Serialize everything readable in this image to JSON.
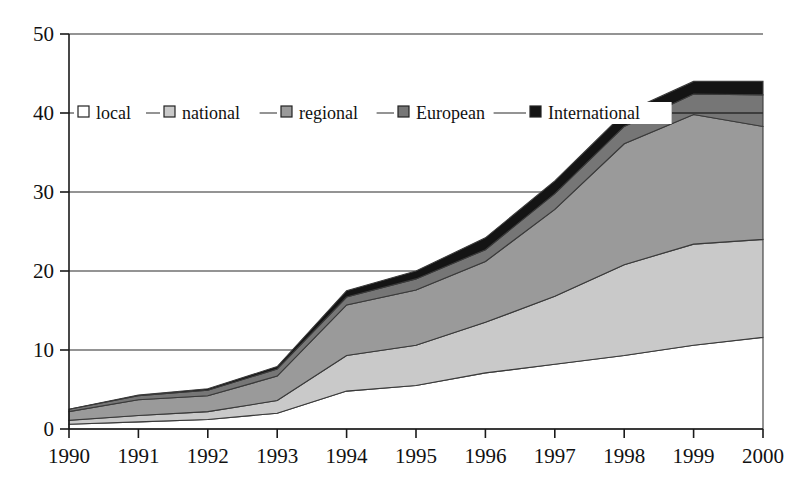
{
  "chart_data": {
    "type": "area",
    "stacked": true,
    "title": "",
    "xlabel": "",
    "ylabel": "",
    "x": [
      1990,
      1991,
      1992,
      1993,
      1994,
      1995,
      1996,
      1997,
      1998,
      1999,
      2000
    ],
    "categories": [
      "1990",
      "1991",
      "1992",
      "1993",
      "1994",
      "1995",
      "1996",
      "1997",
      "1998",
      "1999",
      "2000"
    ],
    "xlim": [
      1990,
      2000
    ],
    "ylim": [
      0,
      50
    ],
    "yticks": [
      0,
      10,
      20,
      30,
      40,
      50
    ],
    "ytick_labels": [
      "0",
      "10",
      "20",
      "30",
      "40",
      "50"
    ],
    "grid": true,
    "grid_axis": "y",
    "legend_position": "inside-top-left",
    "series": [
      {
        "name": "local",
        "color": "#ffffff",
        "values": [
          0.6,
          0.9,
          1.2,
          2.0,
          4.8,
          5.5,
          7.1,
          8.2,
          9.3,
          10.6,
          11.6
        ]
      },
      {
        "name": "national",
        "color": "#c9c9c9",
        "values": [
          0.5,
          0.8,
          1.0,
          1.6,
          4.5,
          5.1,
          6.4,
          8.6,
          11.5,
          12.8,
          12.4
        ]
      },
      {
        "name": "regional",
        "color": "#9a9a9a",
        "values": [
          1.1,
          2.0,
          2.0,
          3.1,
          6.4,
          7.0,
          7.7,
          11.0,
          15.3,
          16.4,
          14.3
        ]
      },
      {
        "name": "European",
        "color": "#767676",
        "values": [
          0.3,
          0.5,
          0.7,
          0.9,
          1.0,
          1.4,
          1.5,
          2.0,
          2.2,
          2.6,
          4.0
        ]
      },
      {
        "name": "International",
        "color": "#141414",
        "values": [
          0.0,
          0.1,
          0.2,
          0.3,
          0.8,
          1.0,
          1.5,
          1.6,
          1.7,
          1.6,
          1.7
        ]
      }
    ],
    "totals": [
      2.5,
      4.3,
      5.1,
      7.9,
      17.5,
      20.0,
      24.2,
      31.4,
      40.0,
      44.0,
      44.0
    ]
  },
  "legend": {
    "items": [
      {
        "label": "local",
        "swatch": "#ffffff"
      },
      {
        "label": "national",
        "swatch": "#c9c9c9"
      },
      {
        "label": "regional",
        "swatch": "#9a9a9a"
      },
      {
        "label": "European",
        "swatch": "#767676"
      },
      {
        "label": "International",
        "swatch": "#141414"
      }
    ]
  },
  "axes": {
    "y_tick_labels": [
      "50",
      "40",
      "30",
      "20",
      "10",
      "0"
    ],
    "x_tick_labels": [
      "1990",
      "1991",
      "1992",
      "1993",
      "1994",
      "1995",
      "1996",
      "1997",
      "1998",
      "1999",
      "2000"
    ]
  }
}
